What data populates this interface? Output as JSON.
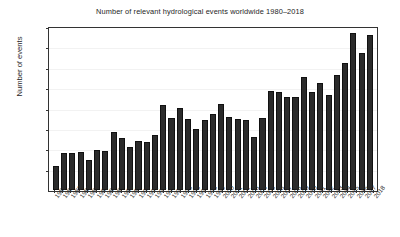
{
  "chart_data": {
    "type": "bar",
    "title": "Number of relevant hydrological events worldwide 1980–2018",
    "xlabel": "",
    "ylabel": "Number of events",
    "ylim": [
      0,
      400
    ],
    "yticks": [
      50,
      100,
      150,
      200,
      250,
      300,
      350,
      400
    ],
    "grid": true,
    "legend": "none",
    "bar_color": "#2b2b2b",
    "background_color": "#ffffff",
    "categories": [
      "1980",
      "1981",
      "1982",
      "1983",
      "1984",
      "1985",
      "1986",
      "1987",
      "1988",
      "1989",
      "1990",
      "1991",
      "1992",
      "1993",
      "1994",
      "1995",
      "1996",
      "1997",
      "1998",
      "1999",
      "2000",
      "2001",
      "2002",
      "2003",
      "2004",
      "2005",
      "2006",
      "2007",
      "2008",
      "2009",
      "2010",
      "2011",
      "2012",
      "2013",
      "2014",
      "2015",
      "2016",
      "2017",
      "2018"
    ],
    "values": [
      60,
      91,
      92,
      93,
      74,
      98,
      96,
      145,
      129,
      107,
      122,
      118,
      136,
      211,
      178,
      205,
      177,
      152,
      174,
      189,
      213,
      182,
      177,
      173,
      132,
      180,
      246,
      243,
      230,
      232,
      281,
      244,
      265,
      236,
      285,
      315,
      390,
      340,
      385
    ]
  }
}
